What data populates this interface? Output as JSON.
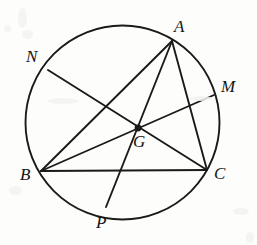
{
  "figure": {
    "canvas": {
      "width": 257,
      "height": 245
    },
    "background_color": "#fdfdfc",
    "stroke_color": "#1a1a1a",
    "stroke_width": 1.9,
    "label_color": "#141414"
  },
  "circle": {
    "name": "circumcircle",
    "cx": 122.5,
    "cy": 122.5,
    "r": 97.0
  },
  "points": [
    {
      "id": "A",
      "label": "A",
      "x": 172,
      "y": 41,
      "label_x": 174,
      "label_y": 18,
      "on_circle": true,
      "vertex_dot": false
    },
    {
      "id": "B",
      "label": "B",
      "x": 41,
      "y": 171,
      "label_x": 20,
      "label_y": 166,
      "on_circle": true,
      "vertex_dot": false
    },
    {
      "id": "C",
      "label": "C",
      "x": 207,
      "y": 170,
      "label_x": 214,
      "label_y": 165,
      "on_circle": true,
      "vertex_dot": false
    },
    {
      "id": "G",
      "label": "G",
      "x": 138,
      "y": 128,
      "label_x": 133,
      "label_y": 133,
      "on_circle": false,
      "vertex_dot": true
    },
    {
      "id": "M",
      "label": "M",
      "x": 214,
      "y": 95,
      "label_x": 221,
      "label_y": 78,
      "on_circle": true,
      "vertex_dot": false
    },
    {
      "id": "N",
      "label": "N",
      "x": 48,
      "y": 70,
      "label_x": 26,
      "label_y": 48,
      "on_circle": true,
      "vertex_dot": false
    },
    {
      "id": "P",
      "label": "P",
      "x": 106,
      "y": 207,
      "label_x": 96,
      "label_y": 214,
      "on_circle": true,
      "vertex_dot": false
    }
  ],
  "segments": [
    {
      "id": "AB",
      "from": "A",
      "to": "B",
      "role": "triangle-side"
    },
    {
      "id": "BC",
      "from": "B",
      "to": "C",
      "role": "triangle-side"
    },
    {
      "id": "CA",
      "from": "C",
      "to": "A",
      "role": "triangle-side"
    },
    {
      "id": "AP",
      "from": "A",
      "to": "P",
      "role": "cevian-through-g"
    },
    {
      "id": "BM",
      "from": "B",
      "to": "M",
      "role": "cevian-through-g"
    },
    {
      "id": "CN",
      "from": "C",
      "to": "N",
      "role": "cevian-through-g"
    }
  ],
  "artifacts": [
    {
      "x": 18,
      "y": 8,
      "w": 9,
      "h": 20
    },
    {
      "x": 4,
      "y": 25,
      "w": 7,
      "h": 7
    },
    {
      "x": 22,
      "y": 30,
      "w": 11,
      "h": 9
    },
    {
      "x": 48,
      "y": 98,
      "w": 30,
      "h": 6
    },
    {
      "x": 190,
      "y": 96,
      "w": 22,
      "h": 5
    },
    {
      "x": 9,
      "y": 186,
      "w": 13,
      "h": 9
    },
    {
      "x": 233,
      "y": 208,
      "w": 16,
      "h": 7
    },
    {
      "x": 246,
      "y": 232,
      "w": 8,
      "h": 11
    }
  ]
}
